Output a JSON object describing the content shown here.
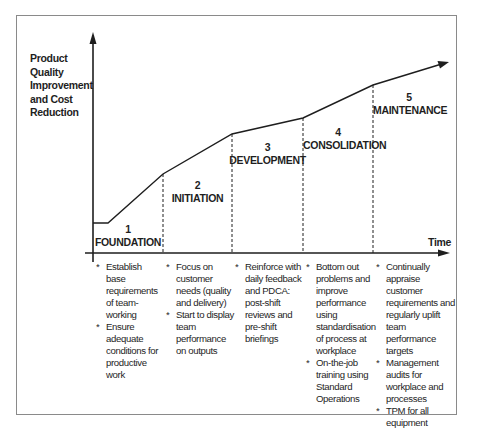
{
  "diagram": {
    "y_axis_label": [
      "Product",
      "Quality",
      "Improvement",
      "and Cost",
      "Reduction"
    ],
    "x_axis_label": "Time",
    "stages": [
      {
        "number": "1",
        "name": "FOUNDATION",
        "bullets": [
          "Establish base requirements of team-working",
          "Ensure adequate conditions for productive work"
        ]
      },
      {
        "number": "2",
        "name": "INITIATION",
        "bullets": [
          "Focus on customer needs (quality and delivery)",
          "Start to display team performance on outputs"
        ]
      },
      {
        "number": "3",
        "name": "DEVELOPMENT",
        "bullets": [
          "Reinforce with daily feedback and PDCA: post-shift reviews and pre-shift briefings"
        ]
      },
      {
        "number": "4",
        "name": "CONSOLIDATION",
        "bullets": [
          "Bottom out problems and improve performance using standardisation of process at workplace",
          "On-the-job training using Standard Operations"
        ]
      },
      {
        "number": "5",
        "name": "MAINTENANCE",
        "bullets": [
          "Continually appraise customer requirements and regularly uplift team performance targets",
          "Management audits for workplace and processes",
          "TPM for all equipment"
        ]
      }
    ],
    "curve_points": [
      [
        93,
        223
      ],
      [
        108,
        223
      ],
      [
        163,
        174
      ],
      [
        232,
        134
      ],
      [
        303,
        118
      ],
      [
        373,
        85
      ],
      [
        448,
        62
      ]
    ],
    "colors": {
      "line": "#1e1e1e",
      "frame": "#8a8a8a",
      "background": "#ffffff"
    }
  }
}
